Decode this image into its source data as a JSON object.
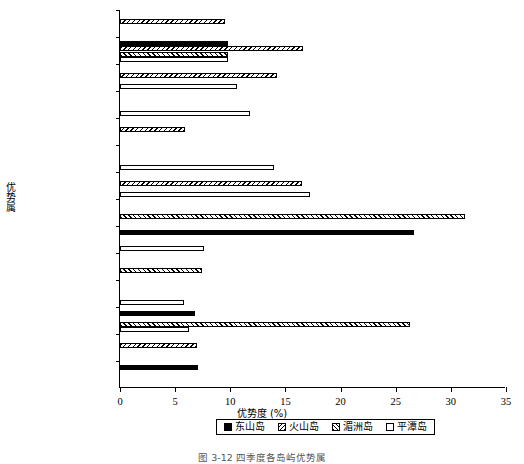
{
  "chart_data": {
    "type": "bar",
    "orientation": "horizontal",
    "title": "",
    "xlabel": "优势度 (%)",
    "ylabel": "优势属",
    "xlim": [
      0,
      35
    ],
    "xticks": [
      0,
      5,
      10,
      15,
      20,
      25,
      30,
      35
    ],
    "grid": false,
    "legend_position": "bottom",
    "categories": [
      "Xyala",
      "Theristus",
      "Rhynchonema",
      "Microlaimus",
      "Monhystera",
      "Metadesmolaimus",
      "Metachromadora",
      "Neochromadora",
      "Lauratonema",
      "Tripyloides",
      "Viscosia",
      "Oncholaimus",
      "Pheronous",
      "Conilia"
    ],
    "series": [
      {
        "name": "东山岛",
        "pattern": "solid-black",
        "color": "#000000",
        "values": [
          0,
          9.8,
          0,
          0,
          0,
          0,
          0,
          0,
          26.7,
          0,
          0,
          6.8,
          0,
          7.1
        ]
      },
      {
        "name": "火山岛",
        "pattern": "backslash-hatch",
        "color": "#000000",
        "values": [
          9.5,
          16.6,
          14.2,
          0,
          5.9,
          0,
          16.5,
          0,
          0,
          0,
          0,
          0,
          7.0,
          0
        ]
      },
      {
        "name": "湄洲岛",
        "pattern": "forwardslash-hatch",
        "color": "#000000",
        "values": [
          0,
          9.8,
          0,
          0,
          0,
          0,
          0,
          31.3,
          0,
          7.4,
          0,
          26.3,
          0,
          0
        ]
      },
      {
        "name": "平潭岛",
        "pattern": "white-empty",
        "color": "#ffffff",
        "values": [
          0,
          9.8,
          10.6,
          11.8,
          0,
          14.0,
          17.2,
          0,
          7.6,
          0,
          5.8,
          6.3,
          0,
          0
        ]
      }
    ]
  },
  "axis": {
    "x_title": "优势度 (%)",
    "y_title": "优势属",
    "tick_labels": [
      "0",
      "5",
      "10",
      "15",
      "20",
      "25",
      "30",
      "35"
    ]
  },
  "legend": {
    "items": [
      {
        "label": "东山岛",
        "pattern": "solid-black"
      },
      {
        "label": "火山岛",
        "pattern": "backslash-hatch"
      },
      {
        "label": "湄洲岛",
        "pattern": "forwardslash-hatch"
      },
      {
        "label": "平潭岛",
        "pattern": "white-empty"
      }
    ]
  },
  "caption": {
    "text": "图 3-12  四季度各岛屿优势属"
  }
}
